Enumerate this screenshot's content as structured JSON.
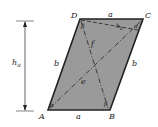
{
  "diagram": {
    "type": "geometry-parallelogram",
    "fill_color": "#9a9a9a",
    "edge_color": "#222222",
    "vertices": {
      "A": {
        "label": "A",
        "x": 48,
        "y": 110
      },
      "B": {
        "label": "B",
        "x": 110,
        "y": 110
      },
      "C": {
        "label": "C",
        "x": 143,
        "y": 19
      },
      "D": {
        "label": "D",
        "x": 80,
        "y": 19
      }
    },
    "sides": {
      "top": "a",
      "bottom": "a",
      "left": "b",
      "right": "b"
    },
    "diagonals": {
      "AC": "e",
      "BD": "f"
    },
    "angles": {
      "A": "α",
      "B": "β",
      "C": "α",
      "D": "β"
    },
    "heights": {
      "h_a": {
        "symbol": "h",
        "subscript": "a"
      },
      "h_b": {
        "symbol": "h",
        "subscript": "b"
      }
    }
  }
}
